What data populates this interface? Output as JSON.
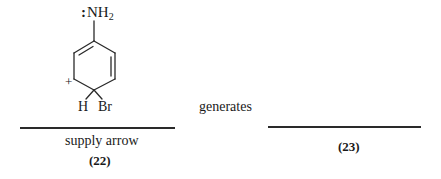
{
  "diagram": {
    "left_structure": {
      "substituent_top": {
        "lone_pair": ":",
        "group": "NH",
        "subscript": "2"
      },
      "charge": "+",
      "sp3_substituents": [
        "H",
        "Br"
      ],
      "bonds": {
        "ring_vertices": [
          [
            94,
            41
          ],
          [
            115,
            53
          ],
          [
            115,
            79
          ],
          [
            94,
            90
          ],
          [
            74,
            79
          ],
          [
            74,
            53
          ]
        ],
        "double_bond_edges": [
          "top-left",
          "right"
        ],
        "stroke_color": "#2a2a2a"
      }
    },
    "left_blank_line_caption": "supply arrow",
    "left_compound_label": "(22)",
    "middle_text": "generates",
    "right_blank_line_caption": "",
    "right_compound_label": "(23)"
  }
}
